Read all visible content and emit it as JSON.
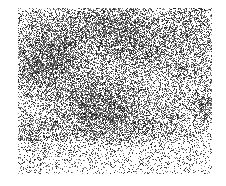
{
  "image": {
    "description": "grayscale speckle noise texture",
    "region": {
      "x": 18,
      "y": 8,
      "width": 194,
      "height": 166
    },
    "background": "#ffffff",
    "ink": "#1a1a1a",
    "blobs": [
      {
        "x": 0.42,
        "y": 0.62,
        "r": 0.14,
        "w": 1.0
      },
      {
        "x": 0.12,
        "y": 0.35,
        "r": 0.12,
        "w": 0.8
      },
      {
        "x": 0.22,
        "y": 0.18,
        "r": 0.12,
        "w": 0.7
      },
      {
        "x": 0.48,
        "y": 0.08,
        "r": 0.1,
        "w": 0.7
      },
      {
        "x": 0.62,
        "y": 0.22,
        "r": 0.12,
        "w": 0.7
      },
      {
        "x": 0.9,
        "y": 0.08,
        "r": 0.1,
        "w": 0.6
      },
      {
        "x": 0.96,
        "y": 0.58,
        "r": 0.06,
        "w": 0.8
      },
      {
        "x": 0.08,
        "y": 0.8,
        "r": 0.1,
        "w": 0.5
      },
      {
        "x": 0.7,
        "y": 0.7,
        "r": 0.12,
        "w": 0.4
      },
      {
        "x": 0.85,
        "y": 0.35,
        "r": 0.1,
        "w": 0.4
      }
    ],
    "base_density": 0.22,
    "seed": 7
  }
}
